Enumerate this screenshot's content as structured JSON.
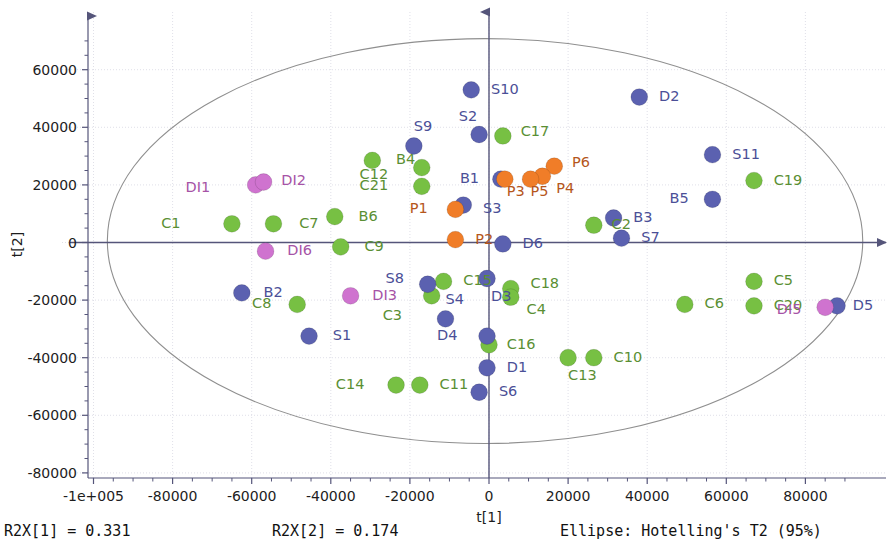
{
  "chart_data": {
    "type": "scatter",
    "title": "",
    "xlabel": "t[1]",
    "ylabel": "t[2]",
    "xlim": [
      -110000,
      95000
    ],
    "ylim": [
      -80000,
      72000
    ],
    "grid": true,
    "legend_position": "none",
    "x_ticks": [
      {
        "value": -100000,
        "label": "-1e+005"
      },
      {
        "value": -80000,
        "label": "-80000"
      },
      {
        "value": -60000,
        "label": "-60000"
      },
      {
        "value": -40000,
        "label": "-40000"
      },
      {
        "value": -20000,
        "label": "-20000"
      },
      {
        "value": 0,
        "label": "0"
      },
      {
        "value": 20000,
        "label": "20000"
      },
      {
        "value": 40000,
        "label": "40000"
      },
      {
        "value": 60000,
        "label": "60000"
      },
      {
        "value": 80000,
        "label": "80000"
      }
    ],
    "y_ticks": [
      {
        "value": 60000,
        "label": "60000"
      },
      {
        "value": 40000,
        "label": "40000"
      },
      {
        "value": 20000,
        "label": "20000"
      },
      {
        "value": 0,
        "label": "0"
      },
      {
        "value": -20000,
        "label": "-20000"
      },
      {
        "value": -40000,
        "label": "-40000"
      },
      {
        "value": -60000,
        "label": "-60000"
      },
      {
        "value": -80000,
        "label": "-80000"
      }
    ],
    "confidence_ellipse": {
      "center_x": -1000,
      "center_y": 500,
      "semi_axis_x": 95500,
      "semi_axis_y": 70300,
      "stroke": "#8f8f8f"
    },
    "group_colors": {
      "green": "#77c043",
      "blue": "#5b61b0",
      "orange": "#f07d28",
      "purple": "#cf73cf"
    },
    "series": [
      {
        "name": "C-group",
        "color": "#77c043",
        "points": [
          {
            "label": "C1",
            "x": -65000,
            "y": 6500,
            "lx": -78000,
            "ly": 6500
          },
          {
            "label": "C7",
            "x": -54500,
            "y": 6500,
            "lx": -48000,
            "ly": 6500
          },
          {
            "label": "B6",
            "x": -39000,
            "y": 9000,
            "lx": -33000,
            "ly": 9000
          },
          {
            "label": "C9",
            "x": -37500,
            "y": -1500,
            "lx": -31500,
            "ly": -1500
          },
          {
            "label": "B4",
            "x": -29500,
            "y": 28500,
            "lx": -23500,
            "ly": 28500
          },
          {
            "label": "C8",
            "x": -48500,
            "y": -21500,
            "lx": -55000,
            "ly": -21500
          },
          {
            "label": "C12",
            "x": -17000,
            "y": 26000,
            "lx": -25500,
            "ly": 23500
          },
          {
            "label": "C21",
            "x": -17000,
            "y": 19500,
            "lx": -25500,
            "ly": 19500
          },
          {
            "label": "C17",
            "x": 3500,
            "y": 37000,
            "lx": 8000,
            "ly": 38500
          },
          {
            "label": "C15",
            "x": -11500,
            "y": -13500,
            "lx": -6500,
            "ly": -13500
          },
          {
            "label": "C3",
            "x": -14500,
            "y": -18500,
            "lx": -22000,
            "ly": -25500
          },
          {
            "label": "C18",
            "x": 5500,
            "y": -16000,
            "lx": 10500,
            "ly": -14500
          },
          {
            "label": "C4",
            "x": 5500,
            "y": -19000,
            "lx": 9500,
            "ly": -23500
          },
          {
            "label": "C16",
            "x": 0,
            "y": -35500,
            "lx": 4500,
            "ly": -35500
          },
          {
            "label": "C14",
            "x": -23500,
            "y": -49500,
            "lx": -31500,
            "ly": -49500
          },
          {
            "label": "C11",
            "x": -17500,
            "y": -49500,
            "lx": -12500,
            "ly": -49500
          },
          {
            "label": "C13",
            "x": 20000,
            "y": -40000,
            "lx": 20000,
            "ly": -46500
          },
          {
            "label": "C10",
            "x": 26500,
            "y": -40000,
            "lx": 31500,
            "ly": -40000
          },
          {
            "label": "C2",
            "x": 26500,
            "y": 6000,
            "lx": 31000,
            "ly": 6000
          },
          {
            "label": "C19",
            "x": 67000,
            "y": 21500,
            "lx": 72000,
            "ly": 21500
          },
          {
            "label": "C5",
            "x": 67000,
            "y": -13500,
            "lx": 72000,
            "ly": -13500
          },
          {
            "label": "C6",
            "x": 49500,
            "y": -21500,
            "lx": 54500,
            "ly": -21500
          },
          {
            "label": "C20",
            "x": 67000,
            "y": -22000,
            "lx": 72000,
            "ly": -22000
          }
        ]
      },
      {
        "name": "S/B/D-group",
        "color": "#5b61b0",
        "points": [
          {
            "label": "S10",
            "x": -4500,
            "y": 53000,
            "lx": 500,
            "ly": 53000
          },
          {
            "label": "D2",
            "x": 38000,
            "y": 50500,
            "lx": 43000,
            "ly": 50500
          },
          {
            "label": "S2",
            "x": -2500,
            "y": 37500,
            "lx": -3000,
            "ly": 43500
          },
          {
            "label": "S9",
            "x": -19000,
            "y": 33500,
            "lx": -19000,
            "ly": 40000
          },
          {
            "label": "S11",
            "x": 56500,
            "y": 30500,
            "lx": 61500,
            "ly": 30500
          },
          {
            "label": "B1",
            "x": 3000,
            "y": 22000,
            "lx": -2500,
            "ly": 22000
          },
          {
            "label": "B5",
            "x": 56500,
            "y": 15000,
            "lx": 50500,
            "ly": 15000
          },
          {
            "label": "S3",
            "x": -6500,
            "y": 13000,
            "lx": -1500,
            "ly": 11500
          },
          {
            "label": "B3",
            "x": 31500,
            "y": 8500,
            "lx": 36500,
            "ly": 8500
          },
          {
            "label": "S7",
            "x": 33500,
            "y": 1500,
            "lx": 38500,
            "ly": 1500
          },
          {
            "label": "D6",
            "x": 3500,
            "y": -500,
            "lx": 8500,
            "ly": -500
          },
          {
            "label": "B2",
            "x": -62500,
            "y": -17500,
            "lx": -57000,
            "ly": -17500
          },
          {
            "label": "S8",
            "x": -15500,
            "y": -14500,
            "lx": -21500,
            "ly": -12500
          },
          {
            "label": "D3",
            "x": -500,
            "y": -12500,
            "lx": 500,
            "ly": -19000
          },
          {
            "label": "S4",
            "x": -11000,
            "y": -26500,
            "lx": -11000,
            "ly": -20000
          },
          {
            "label": "D4",
            "x": -500,
            "y": -32500,
            "lx": -8000,
            "ly": -32500
          },
          {
            "label": "S1",
            "x": -45500,
            "y": -32500,
            "lx": -39500,
            "ly": -32500
          },
          {
            "label": "D1",
            "x": -500,
            "y": -43500,
            "lx": 4500,
            "ly": -43500
          },
          {
            "label": "S6",
            "x": -2500,
            "y": -52000,
            "lx": 2500,
            "ly": -52000
          },
          {
            "label": "D5",
            "x": 88000,
            "y": -22000,
            "lx": 92000,
            "ly": -22000
          }
        ]
      },
      {
        "name": "P-group",
        "color": "#f07d28",
        "points": [
          {
            "label": "P6",
            "x": 16500,
            "y": 26500,
            "lx": 21000,
            "ly": 27500
          },
          {
            "label": "P4",
            "x": 13500,
            "y": 23000,
            "lx": 17000,
            "ly": 18500
          },
          {
            "label": "P5",
            "x": 10500,
            "y": 22000,
            "lx": 10500,
            "ly": 17500
          },
          {
            "label": "P3",
            "x": 4000,
            "y": 22000,
            "lx": 4500,
            "ly": 17500
          },
          {
            "label": "P1",
            "x": -8500,
            "y": 11500,
            "lx": -15500,
            "ly": 11500
          },
          {
            "label": "P2",
            "x": -8500,
            "y": 1000,
            "lx": -3500,
            "ly": 1000
          }
        ]
      },
      {
        "name": "DI-group",
        "color": "#cf73cf",
        "points": [
          {
            "label": "DI1",
            "x": -59000,
            "y": 20000,
            "lx": -70500,
            "ly": 19000
          },
          {
            "label": "DI2",
            "x": -57000,
            "y": 21000,
            "lx": -52500,
            "ly": 21500
          },
          {
            "label": "DI6",
            "x": -56500,
            "y": -3000,
            "lx": -51000,
            "ly": -3000
          },
          {
            "label": "DI3",
            "x": -35000,
            "y": -18500,
            "lx": -29500,
            "ly": -18500
          },
          {
            "label": "DI5",
            "x": 85000,
            "y": -22500,
            "lx": 79000,
            "ly": -23500
          }
        ]
      }
    ]
  },
  "footer": {
    "r2x1": "R2X[1] = 0.331",
    "r2x2": "R2X[2] = 0.174",
    "ellipse_note": "Ellipse: Hotelling's T2 (95%)"
  }
}
